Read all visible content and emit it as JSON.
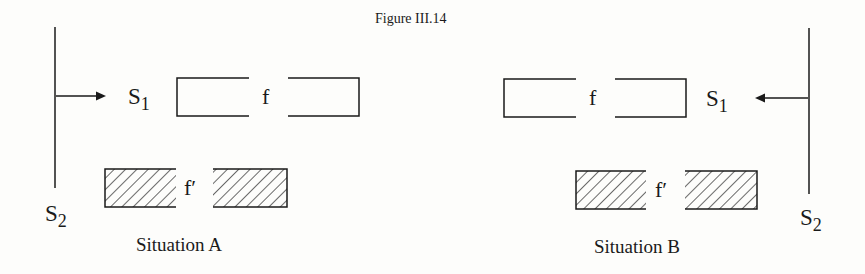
{
  "figure": {
    "title": "Figure III.14"
  },
  "situations": [
    {
      "id": "A",
      "caption": "Situation A",
      "s1_label": "S",
      "s1_sub": "1",
      "s2_label": "S",
      "s2_sub": "2",
      "frame_f_label": "f",
      "frame_fprime_label": "f′",
      "arrow_direction": "right"
    },
    {
      "id": "B",
      "caption": "Situation B",
      "s1_label": "S",
      "s1_sub": "1",
      "s2_label": "S",
      "s2_sub": "2",
      "frame_f_label": "f",
      "frame_fprime_label": "f′",
      "arrow_direction": "left"
    }
  ],
  "colors": {
    "ink": "#1a1a1a",
    "paper": "#fdfdfb"
  }
}
